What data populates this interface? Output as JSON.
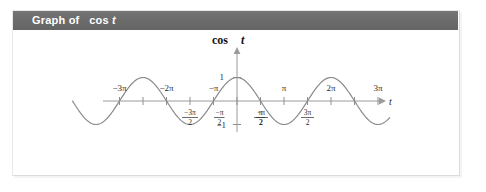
{
  "header": {
    "label_prefix": "Graph of",
    "label_function": "cos",
    "label_variable": "t",
    "bar_color": "#6a6a6a",
    "text_color": "#ffffff"
  },
  "graph": {
    "title_function": "cos",
    "title_variable": "t",
    "axis_x_label": "t",
    "curve_color": "#8a8a8a",
    "axis_color": "#9a9a9a",
    "y_labels": {
      "top": "1",
      "bottom": "−1"
    },
    "x_labels_above": [
      "−3π",
      "−2π",
      "−π",
      "π",
      "2π",
      "3π"
    ],
    "x_labels_below": [
      "− π/2 (as fraction)",
      "− 3π/2 (as fraction)",
      "π/2",
      "3π/2"
    ]
  },
  "chart_data": {
    "type": "line",
    "title": "cos t",
    "xlabel": "t",
    "ylabel": "cos t",
    "function": "y = cos(t)",
    "xlim": [
      -10.99,
      10.21
    ],
    "ylim": [
      -1.35,
      1.35
    ],
    "grid": false,
    "legend": null,
    "x_tick_values": [
      -9.4248,
      -7.854,
      -6.2832,
      -4.7124,
      -3.1416,
      -1.5708,
      1.5708,
      3.1416,
      4.7124,
      6.2832,
      7.854,
      9.4248
    ],
    "x_tick_labels": [
      "−3π",
      "− 3π/2",
      "−2π",
      "− π/2... ",
      "−π",
      "− π/2",
      "π/2",
      "π",
      "3π/2",
      "2π",
      "",
      "3π"
    ],
    "ticks_above_axis": [
      {
        "value": -9.4248,
        "label_num": "−3π"
      },
      {
        "value": -6.2832,
        "label_num": "−2π"
      },
      {
        "value": -3.1416,
        "label_num": "−π"
      },
      {
        "value": 3.1416,
        "label_num": "π"
      },
      {
        "value": 6.2832,
        "label_num": "2π"
      },
      {
        "value": 9.4248,
        "label_num": "3π"
      }
    ],
    "ticks_below_axis": [
      {
        "value": -4.7124,
        "numerator": "−3π",
        "denominator": "2"
      },
      {
        "value": -1.5708,
        "numerator": "−π",
        "denominator": "2"
      },
      {
        "value": 1.5708,
        "numerator": "π",
        "denominator": "2"
      },
      {
        "value": 4.7124,
        "numerator": "3π",
        "denominator": "2"
      }
    ],
    "y_tick_values": [
      1,
      -1
    ],
    "y_tick_labels": [
      "1",
      "−1"
    ],
    "series": [
      {
        "name": "cos t",
        "color": "#8a8a8a",
        "points_note": "y = cos(t) sampled over t in [-10.99, 10.21]"
      }
    ]
  }
}
